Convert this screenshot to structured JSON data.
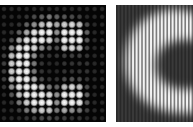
{
  "figure": {
    "panels": [
      {
        "id": "left",
        "description": "Letter C sampled as a grid of bright dots on black background",
        "grid": {
          "cols": 14,
          "rows": 15,
          "pitch_x": 7.55,
          "pitch_y": 7.8,
          "intensity": [
            [
              0.15,
              0.15,
              0.15,
              0.15,
              0.15,
              0.15,
              0.15,
              0.15,
              0.15,
              0.15,
              0.15,
              0.15,
              0.15,
              0.15
            ],
            [
              0.15,
              0.15,
              0.15,
              0.2,
              0.3,
              0.4,
              0.5,
              0.4,
              0.35,
              0.3,
              0.25,
              0.15,
              0.15,
              0.15
            ],
            [
              0.15,
              0.15,
              0.2,
              0.4,
              0.6,
              0.8,
              0.9,
              0.7,
              0.85,
              0.9,
              0.8,
              0.3,
              0.15,
              0.15
            ],
            [
              0.15,
              0.2,
              0.4,
              0.7,
              0.95,
              1,
              1,
              0.6,
              1,
              1,
              1,
              0.4,
              0.15,
              0.15
            ],
            [
              0.15,
              0.3,
              0.7,
              0.95,
              1,
              1,
              0.9,
              0.5,
              1,
              1,
              1,
              0.35,
              0.15,
              0.15
            ],
            [
              0.2,
              0.6,
              0.95,
              1,
              0.9,
              0.6,
              0.4,
              0.3,
              0.85,
              0.9,
              0.8,
              0.25,
              0.15,
              0.15
            ],
            [
              0.25,
              0.8,
              1,
              1,
              0.6,
              0.25,
              0.2,
              0.2,
              0.25,
              0.25,
              0.25,
              0.2,
              0.15,
              0.15
            ],
            [
              0.25,
              0.85,
              1,
              1,
              0.5,
              0.2,
              0.15,
              0.15,
              0.2,
              0.2,
              0.2,
              0.2,
              0.15,
              0.15
            ],
            [
              0.25,
              0.85,
              1,
              1,
              0.5,
              0.2,
              0.15,
              0.15,
              0.2,
              0.2,
              0.2,
              0.2,
              0.15,
              0.15
            ],
            [
              0.25,
              0.8,
              1,
              1,
              0.7,
              0.3,
              0.2,
              0.2,
              0.3,
              0.35,
              0.3,
              0.2,
              0.15,
              0.15
            ],
            [
              0.2,
              0.6,
              0.95,
              1,
              1,
              0.8,
              0.5,
              0.4,
              0.8,
              0.9,
              0.8,
              0.3,
              0.15,
              0.15
            ],
            [
              0.15,
              0.35,
              0.8,
              1,
              1,
              1,
              0.9,
              0.6,
              1,
              1,
              1,
              0.4,
              0.15,
              0.15
            ],
            [
              0.15,
              0.2,
              0.5,
              0.85,
              1,
              1,
              1,
              0.6,
              1,
              1,
              0.95,
              0.35,
              0.15,
              0.15
            ],
            [
              0.15,
              0.15,
              0.25,
              0.5,
              0.7,
              0.85,
              0.8,
              0.5,
              0.7,
              0.6,
              0.5,
              0.25,
              0.15,
              0.15
            ],
            [
              0.15,
              0.15,
              0.15,
              0.2,
              0.25,
              0.3,
              0.3,
              0.25,
              0.25,
              0.2,
              0.2,
              0.15,
              0.15,
              0.15
            ]
          ]
        },
        "colors": {
          "background": "#050505",
          "dot": "#ffffff"
        }
      },
      {
        "id": "right",
        "description": "Blurred letter C with vertical stripe modulation",
        "stripes": {
          "pitch": 3.6,
          "count": 22
        },
        "colors": {
          "background": "#2a2a2a",
          "bright": "#f2f2f2",
          "stripe_dark": "#1a1a1a"
        }
      }
    ]
  }
}
